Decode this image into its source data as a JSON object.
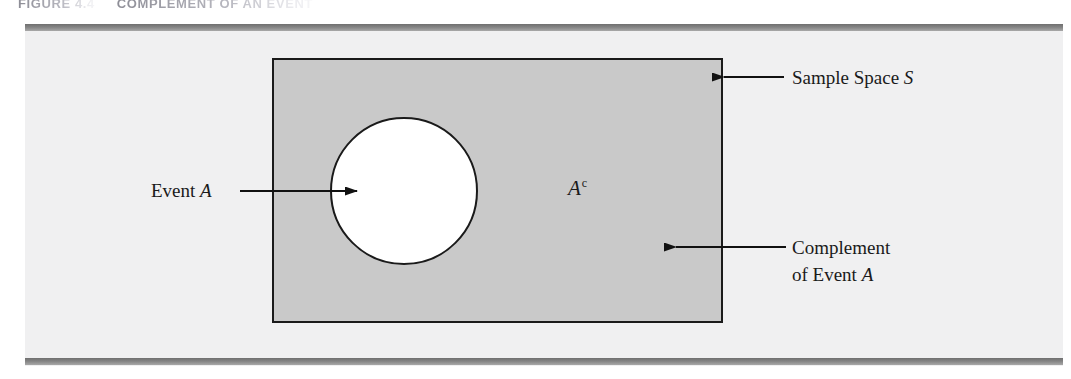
{
  "figure": {
    "caption_number": "FIGURE 4.4",
    "caption_title": "COMPLEMENT OF AN EVENT",
    "type": "venn-diagram"
  },
  "diagram": {
    "sample_space": {
      "shape": "rectangle",
      "label": "Sample Space",
      "symbol": "S",
      "fill_color": "#c9c9c9",
      "stroke_color": "#1a1a1a"
    },
    "event": {
      "shape": "circle",
      "label": "Event",
      "symbol": "A",
      "fill_color": "#ffffff",
      "stroke_color": "#1a1a1a"
    },
    "complement": {
      "label_line1": "Complement",
      "label_line2_prefix": "of Event",
      "label_line2_symbol": "A",
      "inner_symbol_base": "A",
      "inner_symbol_sup": "c"
    },
    "background_color": "#f0f0f1",
    "rule_color": "#7b7b7b"
  },
  "annotations": {
    "arrow_event": {
      "name": "arrow-event-a",
      "direction": "right",
      "from_label": "Event A",
      "to_target": "event-circle"
    },
    "arrow_sample_space": {
      "name": "arrow-sample-space",
      "direction": "left",
      "from_label": "Sample Space S",
      "to_target": "sample-space-rect"
    },
    "arrow_complement": {
      "name": "arrow-complement",
      "direction": "left",
      "from_label": "Complement of Event A",
      "to_target": "shaded-region"
    }
  }
}
